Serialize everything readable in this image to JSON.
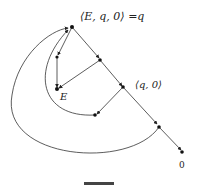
{
  "diagram": {
    "type": "state-graph",
    "nodes": {
      "top": {
        "label": "⟨E, q, 0⟩ =q"
      },
      "mid": {
        "label": "⟨q, 0⟩"
      },
      "e": {
        "label": "E"
      },
      "end": {
        "label": "0"
      }
    },
    "caption": "图"
  },
  "colors": {
    "stroke": "#333333",
    "node": "#111111",
    "background": "#ffffff"
  }
}
